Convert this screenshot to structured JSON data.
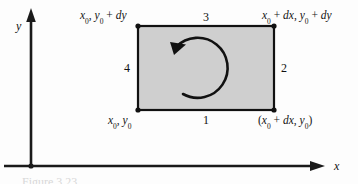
{
  "figure": {
    "axes": {
      "x_label": "x",
      "y_label": "y"
    },
    "corner_labels": {
      "top_left": "x0, y0 + dy",
      "top_right": "x0 + dx, y0 + dy",
      "bottom_left": "x0, y0",
      "bottom_right": "(x0 + dx, y0)"
    },
    "edge_numbers": {
      "bottom": "1",
      "right": "2",
      "top": "3",
      "left": "4"
    },
    "caption": "Figure 3.23",
    "colors": {
      "rectangle_fill": "#cfcfcf",
      "rectangle_stroke": "#111111",
      "axis": "#1a1a1a",
      "arrow": "#111111"
    },
    "circulation_direction": "counterclockwise"
  }
}
